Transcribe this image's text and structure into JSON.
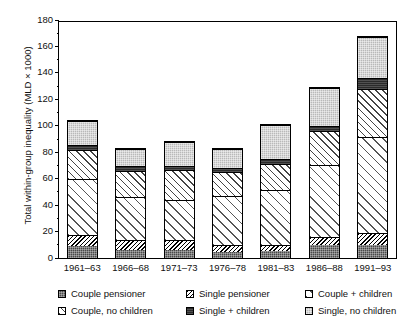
{
  "chart_data": {
    "type": "bar",
    "subtype": "stacked",
    "title": "",
    "xlabel": "",
    "ylabel": "Total within-group inequality (MLD × 1000)",
    "ylim": [
      0,
      180
    ],
    "ytick_step": 20,
    "yticks": [
      0,
      20,
      40,
      60,
      80,
      100,
      120,
      140,
      160,
      180
    ],
    "minor_tick_step": 10,
    "grid": false,
    "legend_position": "below",
    "categories": [
      "1961–63",
      "1966–68",
      "1971–73",
      "1976–78",
      "1981–83",
      "1986–88",
      "1991–93"
    ],
    "series": [
      {
        "name": "Couple pensioner",
        "values": [
          9,
          6,
          6,
          5,
          5,
          10,
          10
        ]
      },
      {
        "name": "Single pensioner",
        "values": [
          9,
          8,
          8,
          5,
          5,
          6,
          9
        ]
      },
      {
        "name": "Couple + children",
        "values": [
          43,
          33,
          31,
          38,
          42,
          55,
          73
        ]
      },
      {
        "name": "Couple, no children",
        "values": [
          22,
          20,
          23,
          18,
          20,
          26,
          37
        ]
      },
      {
        "name": "Single + children",
        "values": [
          4,
          4,
          3,
          3,
          4,
          4,
          8
        ]
      },
      {
        "name": "Single, no children",
        "values": [
          18,
          13,
          18,
          15,
          26,
          29,
          32
        ]
      }
    ],
    "totals": [
      105,
      84,
      89,
      84,
      102,
      130,
      169
    ]
  },
  "axis": {
    "ytitle": "Total within-group inequality (MLD × 1000)",
    "ylabels": [
      "0",
      "20",
      "40",
      "60",
      "80",
      "100",
      "120",
      "140",
      "160",
      "180"
    ],
    "xlabels": [
      "1961–63",
      "1966–68",
      "1971–73",
      "1976–78",
      "1981–83",
      "1986–88",
      "1991–93"
    ]
  },
  "legend": {
    "rows": [
      [
        {
          "label": "Couple pensioner",
          "pattern": "p-couple-pens",
          "color": "#4a4a4a"
        },
        {
          "label": "Single pensioner",
          "pattern": "p-single-pens",
          "color": "#ffffff"
        },
        {
          "label": "Couple + children",
          "pattern": "p-couple-ch",
          "color": "#ffffff"
        }
      ],
      [
        {
          "label": "Couple, no children",
          "pattern": "p-couple-noch",
          "color": "#ffffff"
        },
        {
          "label": "Single + children",
          "pattern": "p-single-ch",
          "color": "#2b2b2b"
        },
        {
          "label": "Single, no children",
          "pattern": "p-single-noch",
          "color": "#b9b9b9"
        }
      ]
    ]
  }
}
